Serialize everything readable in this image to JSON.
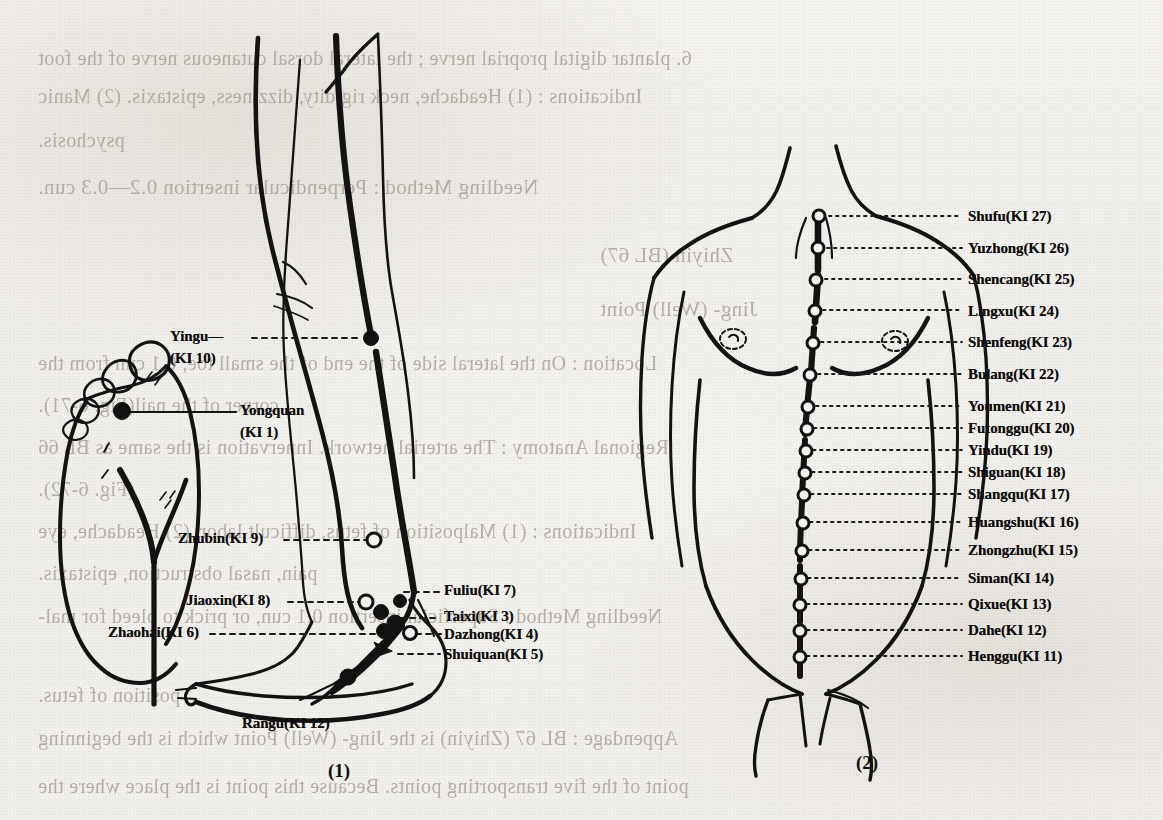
{
  "page": {
    "background_color": "#f1efeb",
    "ink_color": "#111111",
    "bleed_color": "#a9a49b"
  },
  "figures": [
    {
      "caption": "(1)",
      "name": "figure-1-leg-and-foot"
    },
    {
      "caption": "(2)",
      "name": "figure-2-torso"
    }
  ],
  "figure1_labels": [
    {
      "text": "Yingu—",
      "name": "label-yingu"
    },
    {
      "text": "(KI  10)",
      "name": "label-yingu-code"
    },
    {
      "text": "Yongquan",
      "name": "label-yongquan"
    },
    {
      "text": "(KI  1)",
      "name": "label-yongquan-code"
    },
    {
      "text": "Zhubin(KI 9)",
      "name": "label-zhubin"
    },
    {
      "text": "Jiaoxin(KI 8)",
      "name": "label-jiaoxin"
    },
    {
      "text": "Zhaohai(KI 6)",
      "name": "label-zhaohai"
    },
    {
      "text": "Fuliu(KI 7)",
      "name": "label-fuliu"
    },
    {
      "text": "Taixi(KI 3)",
      "name": "label-taixi"
    },
    {
      "text": "Dazhong(KI 4)",
      "name": "label-dazhong"
    },
    {
      "text": "Shuiquan(KI 5)",
      "name": "label-shuiquan"
    },
    {
      "text": "Rangu(KI 12)",
      "name": "label-rangu"
    }
  ],
  "figure2_labels": [
    {
      "text": "Shufu(KI 27)",
      "name": "label-shufu"
    },
    {
      "text": "Yuzhong(KI 26)",
      "name": "label-yuzhong"
    },
    {
      "text": "Shencang(KI 25)",
      "name": "label-shencang"
    },
    {
      "text": "Lingxu(KI 24)",
      "name": "label-lingxu"
    },
    {
      "text": "Shenfeng(KI 23)",
      "name": "label-shenfeng"
    },
    {
      "text": "Bulang(KI 22)",
      "name": "label-bulang"
    },
    {
      "text": "Youmen(KI 21)",
      "name": "label-youmen"
    },
    {
      "text": "Futonggu(KI 20)",
      "name": "label-futonggu"
    },
    {
      "text": "Yindu(KI 19)",
      "name": "label-yindu"
    },
    {
      "text": "Shiguan(KI 18)",
      "name": "label-shiguan"
    },
    {
      "text": "Shangqu(KI 17)",
      "name": "label-shangqu"
    },
    {
      "text": "Huangshu(KI 16)",
      "name": "label-huangshu"
    },
    {
      "text": "Zhongzhu(KI 15)",
      "name": "label-zhongzhu"
    },
    {
      "text": "Siman(KI 14)",
      "name": "label-siman"
    },
    {
      "text": "Qixue(KI 13)",
      "name": "label-qixue"
    },
    {
      "text": "Dahe(KI 12)",
      "name": "label-dahe"
    },
    {
      "text": "Henggu(KI 11)",
      "name": "label-henggu"
    }
  ],
  "bleed_through_text": [
    {
      "text": "6. plantar digital proprial nerve ; the lateral dorsal cutaneous nerve of the foot",
      "name": "bleed-line-1"
    },
    {
      "text": "Indications : (1) Headache, neck rigidity, dizziness, epistaxis. (2) Manic",
      "name": "bleed-line-2"
    },
    {
      "text": "psychosis.",
      "name": "bleed-line-3"
    },
    {
      "text": "Needling Method : Perpendicular insertion 0.2—0.3 cun.",
      "name": "bleed-line-4"
    },
    {
      "text": "Zhiyin (BL 67)",
      "name": "bleed-line-5"
    },
    {
      "text": "Jing- (Well) Point",
      "name": "bleed-line-6"
    },
    {
      "text": "Location : On the lateral side of the end of the small toe, 0.1 cun from the",
      "name": "bleed-line-7"
    },
    {
      "text": "corner of the nail(Fig. 6-71).",
      "name": "bleed-line-8"
    },
    {
      "text": "Regional Anatomy : The arterial network. Innervation is the same as BL 66",
      "name": "bleed-line-9"
    },
    {
      "text": "(Fig. 6-72).",
      "name": "bleed-line-10"
    },
    {
      "text": "Indications : (1) Malposition of fetus, difficult labor. (2) Headache, eye",
      "name": "bleed-line-11"
    },
    {
      "text": "pain, nasal obstruction, epistaxis.",
      "name": "bleed-line-12"
    },
    {
      "text": "Needling Method : Superficial insertion 0.1 cun, or prick to bleed for mal-",
      "name": "bleed-line-13"
    },
    {
      "text": "position of fetus.",
      "name": "bleed-line-14"
    },
    {
      "text": "Appendage : BL 67 (Zhiyin) is the Jing- (Well) Point which is the beginning",
      "name": "bleed-line-15"
    },
    {
      "text": "point of the five transporting points. Because this point is the place where the",
      "name": "bleed-line-16"
    }
  ]
}
